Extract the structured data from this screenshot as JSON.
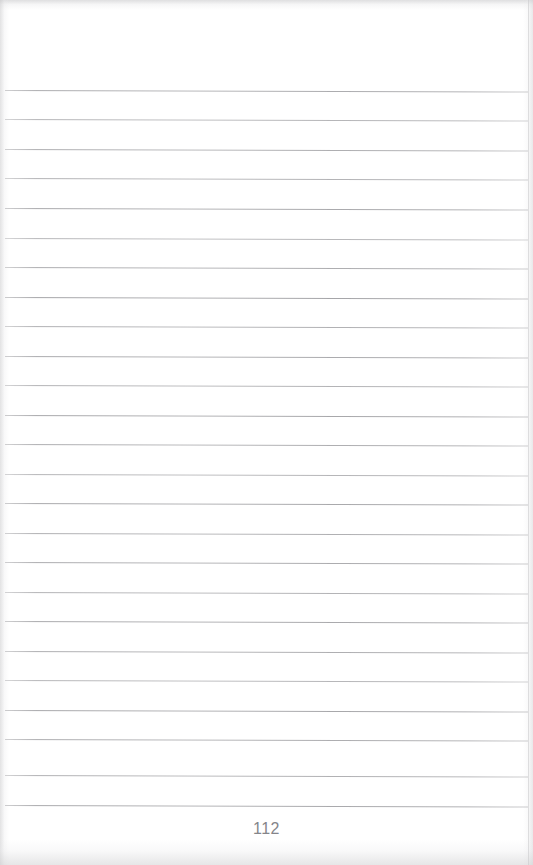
{
  "document": {
    "kind": "scanned-lined-notebook-page",
    "page_number": "112",
    "paper_color": "#ffffff",
    "rule_color": "#8c8c90",
    "page_number_color": "#85858a",
    "rule_count": 25,
    "rule_start_x": 5,
    "rule_end_x": 528,
    "first_rule_y": 90,
    "rule_spacing": 29.7,
    "skew_degrees": 0.16,
    "content_text": "",
    "rules": [
      {
        "index": 1,
        "y": 90,
        "opacity": 0.72
      },
      {
        "index": 2,
        "y": 119,
        "opacity": 0.64
      },
      {
        "index": 3,
        "y": 149,
        "opacity": 0.7
      },
      {
        "index": 4,
        "y": 178,
        "opacity": 0.66
      },
      {
        "index": 5,
        "y": 208,
        "opacity": 0.74
      },
      {
        "index": 6,
        "y": 238,
        "opacity": 0.62
      },
      {
        "index": 7,
        "y": 267,
        "opacity": 0.71
      },
      {
        "index": 8,
        "y": 297,
        "opacity": 0.78
      },
      {
        "index": 9,
        "y": 326,
        "opacity": 0.68
      },
      {
        "index": 10,
        "y": 356,
        "opacity": 0.73
      },
      {
        "index": 11,
        "y": 385,
        "opacity": 0.66
      },
      {
        "index": 12,
        "y": 415,
        "opacity": 0.76
      },
      {
        "index": 13,
        "y": 444,
        "opacity": 0.7
      },
      {
        "index": 14,
        "y": 474,
        "opacity": 0.64
      },
      {
        "index": 15,
        "y": 503,
        "opacity": 0.75
      },
      {
        "index": 16,
        "y": 533,
        "opacity": 0.69
      },
      {
        "index": 17,
        "y": 562,
        "opacity": 0.72
      },
      {
        "index": 18,
        "y": 592,
        "opacity": 0.66
      },
      {
        "index": 19,
        "y": 621,
        "opacity": 0.74
      },
      {
        "index": 20,
        "y": 651,
        "opacity": 0.7
      },
      {
        "index": 21,
        "y": 680,
        "opacity": 0.63
      },
      {
        "index": 22,
        "y": 710,
        "opacity": 0.76
      },
      {
        "index": 23,
        "y": 739,
        "opacity": 0.71
      },
      {
        "index": 24,
        "y": 775,
        "opacity": 0.68
      },
      {
        "index": 25,
        "y": 805,
        "opacity": 0.74
      }
    ]
  }
}
